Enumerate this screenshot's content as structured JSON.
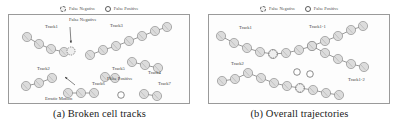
{
  "figure": {
    "panels": [
      {
        "id": "a",
        "caption": "(a) Broken cell tracks",
        "legend": [
          {
            "label": "False Negative",
            "marker": "dashed-circle-icon",
            "color": "#6e6e6e"
          },
          {
            "label": "False Positive",
            "marker": "outline-circle-icon",
            "color": "#5a5a5a"
          }
        ],
        "annotations": [
          {
            "text": "Track1",
            "x": 36,
            "y": 13
          },
          {
            "text": "False Negative",
            "x": 60,
            "y": 6
          },
          {
            "text": "Track3",
            "x": 101,
            "y": 12
          },
          {
            "text": "Track5",
            "x": 103,
            "y": 55
          },
          {
            "text": "Track4",
            "x": 139,
            "y": 59
          },
          {
            "text": "False Positive",
            "x": 98,
            "y": 65
          },
          {
            "text": "Track2",
            "x": 28,
            "y": 55
          },
          {
            "text": "Erratic Motion",
            "x": 36,
            "y": 85
          },
          {
            "text": "Track6",
            "x": 83,
            "y": 70
          },
          {
            "text": "Track7",
            "x": 149,
            "y": 70
          }
        ],
        "tracks": [
          {
            "name": "Track1",
            "points": [
              [
                18,
                22
              ],
              [
                30,
                29
              ],
              [
                42,
                34
              ],
              [
                55,
                37
              ]
            ]
          },
          {
            "name": "Track3",
            "points": [
              [
                81,
                40
              ],
              [
                94,
                35
              ],
              [
                107,
                31
              ],
              [
                120,
                26
              ],
              [
                133,
                21
              ],
              [
                146,
                16
              ],
              [
                158,
                12
              ]
            ]
          },
          {
            "name": "Track4",
            "points": [
              [
                123,
                47
              ],
              [
                136,
                50
              ],
              [
                149,
                53
              ]
            ]
          },
          {
            "name": "Track2",
            "points": [
              [
                17,
                71
              ],
              [
                30,
                68
              ],
              [
                43,
                63
              ]
            ]
          },
          {
            "name": "Track5",
            "points": [
              [
                96,
                62
              ],
              [
                106,
                63
              ]
            ]
          },
          {
            "name": "Track6",
            "points": [
              [
                59,
                78
              ],
              [
                72,
                78
              ],
              [
                85,
                78
              ]
            ]
          },
          {
            "name": "Track7",
            "points": [
              [
                135,
                79
              ],
              [
                148,
                81
              ]
            ]
          }
        ],
        "false_negatives": [
          [
            62,
            36
          ]
        ],
        "false_positives": [
          [
            112,
            80
          ]
        ],
        "arrows": [
          {
            "from": [
              61,
              12
            ],
            "to": [
              62,
              28
            ]
          },
          {
            "from": [
              66,
              70
            ],
            "to": [
              56,
              62
            ]
          }
        ]
      },
      {
        "id": "b",
        "caption": "(b) Overall trajectories",
        "legend": [
          {
            "label": "False Negative",
            "marker": "dashed-circle-icon",
            "color": "#6e6e6e"
          },
          {
            "label": "False Positive",
            "marker": "outline-circle-icon",
            "color": "#5a5a5a"
          }
        ],
        "annotations": [
          {
            "text": "Track1",
            "x": 30,
            "y": 14
          },
          {
            "text": "Track1-1",
            "x": 100,
            "y": 13
          },
          {
            "text": "Track1-2",
            "x": 139,
            "y": 66
          },
          {
            "text": "Track2",
            "x": 22,
            "y": 50
          }
        ],
        "tracks": [
          {
            "name": "Track1-1",
            "points": [
              [
                12,
                21
              ],
              [
                25,
                28
              ],
              [
                38,
                33
              ],
              [
                51,
                37
              ],
              [
                64,
                39
              ],
              [
                77,
                38
              ],
              [
                90,
                35
              ],
              [
                103,
                31
              ],
              [
                116,
                26
              ],
              [
                129,
                21
              ],
              [
                142,
                15
              ],
              [
                154,
                11
              ]
            ]
          },
          {
            "name": "Track1-2",
            "points": [
              [
                103,
                31
              ],
              [
                116,
                38
              ],
              [
                129,
                44
              ],
              [
                142,
                49
              ],
              [
                155,
                52
              ]
            ]
          },
          {
            "name": "Track2",
            "points": [
              [
                13,
                66
              ],
              [
                26,
                64
              ],
              [
                39,
                58
              ],
              [
                52,
                63
              ],
              [
                65,
                68
              ],
              [
                78,
                71
              ],
              [
                91,
                73
              ],
              [
                104,
                75
              ],
              [
                117,
                78
              ],
              [
                130,
                80
              ]
            ]
          }
        ],
        "false_negatives": [
          [
            64,
            39
          ],
          [
            91,
            73
          ]
        ],
        "false_positives": [
          [
            88,
            57
          ],
          [
            101,
            59
          ]
        ],
        "arrows": []
      }
    ]
  },
  "style": {
    "cell_fill": "#dcdcdc",
    "cell_stroke": "#808080",
    "track_line": "#555555",
    "panel_border": "#9a9a9a"
  }
}
